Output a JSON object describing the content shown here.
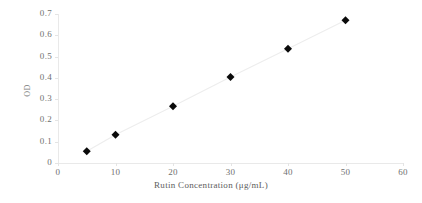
{
  "chart_data": {
    "type": "scatter",
    "title": "",
    "xlabel": "Rutin Concentration (μg/mL)",
    "ylabel": "OD",
    "x": [
      5,
      10,
      20,
      30,
      40,
      50
    ],
    "values": [
      0.055,
      0.133,
      0.267,
      0.404,
      0.537,
      0.671
    ],
    "series": [
      {
        "name": "OD",
        "values": [
          0.055,
          0.133,
          0.267,
          0.404,
          0.537,
          0.671
        ],
        "marker": "diamond",
        "marker_color": "#0a0a0a",
        "line_color": "#ededed"
      }
    ],
    "xlim": [
      0,
      60
    ],
    "ylim": [
      0,
      0.7
    ],
    "xticks": [
      "0",
      "10",
      "20",
      "30",
      "40",
      "50",
      "60"
    ],
    "xtick_values": [
      0,
      10,
      20,
      30,
      40,
      50,
      60
    ],
    "yticks": [
      "0",
      "0.1",
      "0.2",
      "0.3",
      "0.4",
      "0.5",
      "0.6",
      "0.7"
    ],
    "ytick_values": [
      0,
      0.1,
      0.2,
      0.3,
      0.4,
      0.5,
      0.6,
      0.7
    ],
    "grid": false,
    "legend": "none",
    "annotations": []
  },
  "axes": {
    "x_title": "Rutin Concentration (μg/mL)",
    "y_title": "OD"
  },
  "colors": {
    "background": "#ffffff",
    "axis": "#e9e9e9",
    "tick_text": "#6f6f6f",
    "marker": "#0a0a0a",
    "line": "#ededed"
  }
}
